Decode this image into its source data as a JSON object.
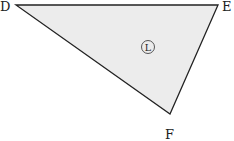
{
  "diagram": {
    "type": "triangle",
    "vertices": [
      {
        "name": "D",
        "label": "D",
        "x": 16,
        "y": 5
      },
      {
        "name": "E",
        "label": "E",
        "x": 218,
        "y": 5
      },
      {
        "name": "F",
        "label": "F",
        "x": 170,
        "y": 114
      }
    ],
    "region_label": "L",
    "fill_color": "#ececec",
    "stroke_color": "#222222"
  }
}
